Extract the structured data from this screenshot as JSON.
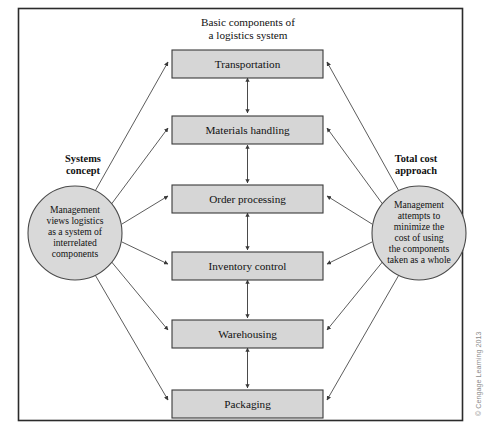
{
  "figure": {
    "title_line1": "Basic components of",
    "title_line2": "a logistics system",
    "credit": "© Cengage Learning 2013",
    "frame_color": "#2b2b2b",
    "box_fill": "#d6d6d6",
    "circle_fill": "#d9d9d9",
    "line_color": "#4a4a4a"
  },
  "components": [
    {
      "label": "Transportation"
    },
    {
      "label": "Materials handling"
    },
    {
      "label": "Order processing"
    },
    {
      "label": "Inventory control"
    },
    {
      "label": "Warehousing"
    },
    {
      "label": "Packaging"
    }
  ],
  "left_node": {
    "caption_line1": "Systems",
    "caption_line2": "concept",
    "body_line1": "Management",
    "body_line2": "views logistics",
    "body_line3": "as a system of",
    "body_line4": "interrelated",
    "body_line5": "components"
  },
  "right_node": {
    "caption_line1": "Total cost",
    "caption_line2": "approach",
    "body_line1": "Management",
    "body_line2": "attempts to",
    "body_line3": "minimize the",
    "body_line4": "cost of using",
    "body_line5": "the components",
    "body_line6": "taken as a whole"
  }
}
